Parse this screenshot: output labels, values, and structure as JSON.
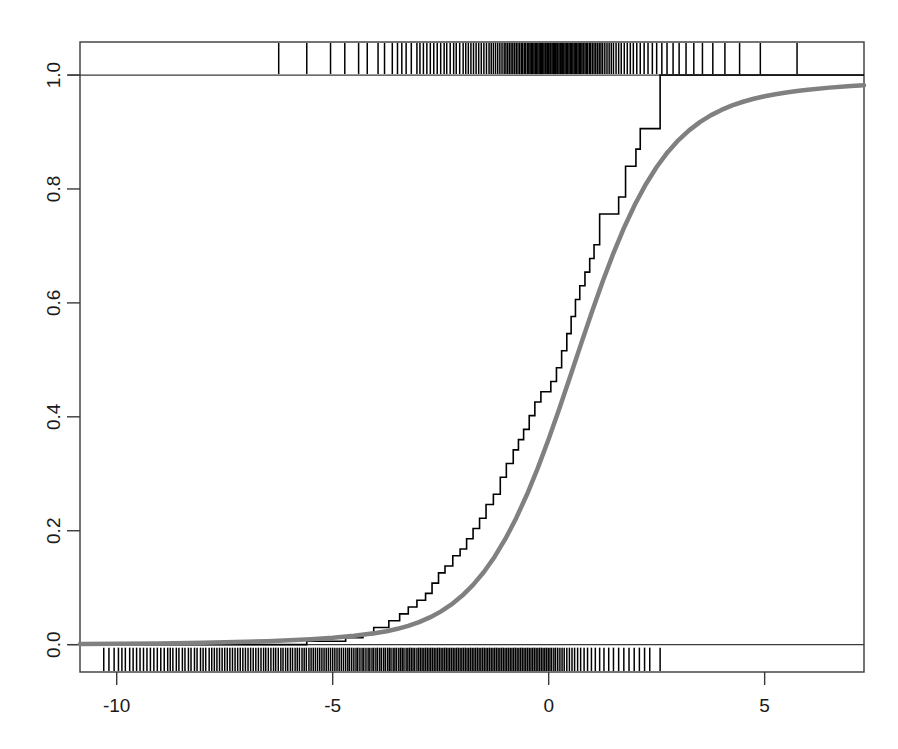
{
  "chart_data": {
    "type": "line",
    "title": "",
    "subtitle": "",
    "xlabel": "",
    "ylabel": "",
    "xlim": [
      -10.85,
      7.3
    ],
    "ylim": [
      -0.048,
      1.058
    ],
    "grid": false,
    "legend_position": "none",
    "xticks": [
      -10,
      -5,
      0,
      5
    ],
    "xticklabels": [
      "-10",
      "-5",
      "0",
      "5"
    ],
    "yticks": [
      0.0,
      0.2,
      0.4,
      0.6,
      0.8,
      1.0
    ],
    "yticklabels": [
      "0.0",
      "0.2",
      "0.4",
      "0.6",
      "0.8",
      "1.0"
    ],
    "series": [
      {
        "name": "empirical-cdf-step",
        "type": "step",
        "color": "#000000",
        "linewidth": 1.6,
        "points": [
          [
            -10.85,
            0.0
          ],
          [
            -5.6,
            0.0
          ],
          [
            -5.6,
            0.006
          ],
          [
            -4.7,
            0.006
          ],
          [
            -4.7,
            0.012
          ],
          [
            -4.3,
            0.012
          ],
          [
            -4.3,
            0.018
          ],
          [
            -4.05,
            0.018
          ],
          [
            -4.05,
            0.03
          ],
          [
            -3.7,
            0.03
          ],
          [
            -3.7,
            0.042
          ],
          [
            -3.45,
            0.042
          ],
          [
            -3.45,
            0.054
          ],
          [
            -3.25,
            0.054
          ],
          [
            -3.25,
            0.066
          ],
          [
            -3.05,
            0.066
          ],
          [
            -3.05,
            0.078
          ],
          [
            -2.85,
            0.078
          ],
          [
            -2.85,
            0.09
          ],
          [
            -2.7,
            0.09
          ],
          [
            -2.7,
            0.108
          ],
          [
            -2.55,
            0.108
          ],
          [
            -2.55,
            0.126
          ],
          [
            -2.4,
            0.126
          ],
          [
            -2.4,
            0.138
          ],
          [
            -2.22,
            0.138
          ],
          [
            -2.22,
            0.156
          ],
          [
            -2.05,
            0.156
          ],
          [
            -2.05,
            0.168
          ],
          [
            -1.9,
            0.168
          ],
          [
            -1.9,
            0.186
          ],
          [
            -1.75,
            0.186
          ],
          [
            -1.75,
            0.204
          ],
          [
            -1.6,
            0.204
          ],
          [
            -1.6,
            0.222
          ],
          [
            -1.45,
            0.222
          ],
          [
            -1.45,
            0.246
          ],
          [
            -1.28,
            0.246
          ],
          [
            -1.28,
            0.264
          ],
          [
            -1.12,
            0.264
          ],
          [
            -1.12,
            0.294
          ],
          [
            -0.98,
            0.294
          ],
          [
            -0.98,
            0.318
          ],
          [
            -0.82,
            0.318
          ],
          [
            -0.82,
            0.342
          ],
          [
            -0.7,
            0.342
          ],
          [
            -0.7,
            0.36
          ],
          [
            -0.58,
            0.36
          ],
          [
            -0.58,
            0.378
          ],
          [
            -0.45,
            0.378
          ],
          [
            -0.45,
            0.402
          ],
          [
            -0.32,
            0.402
          ],
          [
            -0.32,
            0.426
          ],
          [
            -0.18,
            0.426
          ],
          [
            -0.18,
            0.444
          ],
          [
            0.05,
            0.444
          ],
          [
            0.05,
            0.462
          ],
          [
            0.18,
            0.462
          ],
          [
            0.18,
            0.486
          ],
          [
            0.3,
            0.486
          ],
          [
            0.3,
            0.516
          ],
          [
            0.42,
            0.516
          ],
          [
            0.42,
            0.546
          ],
          [
            0.52,
            0.546
          ],
          [
            0.52,
            0.576
          ],
          [
            0.62,
            0.576
          ],
          [
            0.62,
            0.606
          ],
          [
            0.72,
            0.606
          ],
          [
            0.72,
            0.63
          ],
          [
            0.84,
            0.63
          ],
          [
            0.84,
            0.654
          ],
          [
            0.95,
            0.654
          ],
          [
            0.95,
            0.678
          ],
          [
            1.05,
            0.678
          ],
          [
            1.05,
            0.702
          ],
          [
            1.18,
            0.702
          ],
          [
            1.18,
            0.756
          ],
          [
            1.62,
            0.756
          ],
          [
            1.62,
            0.786
          ],
          [
            1.78,
            0.786
          ],
          [
            1.78,
            0.84
          ],
          [
            2.02,
            0.84
          ],
          [
            2.02,
            0.87
          ],
          [
            2.12,
            0.87
          ],
          [
            2.12,
            0.906
          ],
          [
            2.58,
            0.906
          ],
          [
            2.58,
            1.0
          ],
          [
            7.3,
            1.0
          ]
        ]
      },
      {
        "name": "fitted-cdf-curve",
        "type": "line",
        "color": "#808080",
        "linewidth": 4.5,
        "description": "smooth fitted cumulative distribution function",
        "points": [
          [
            -10.85,
            0.001
          ],
          [
            -10.0,
            0.0014
          ],
          [
            -9.0,
            0.0021
          ],
          [
            -8.0,
            0.0032
          ],
          [
            -7.0,
            0.0049
          ],
          [
            -6.5,
            0.0061
          ],
          [
            -6.0,
            0.0077
          ],
          [
            -5.5,
            0.0097
          ],
          [
            -5.0,
            0.0122
          ],
          [
            -4.5,
            0.0156
          ],
          [
            -4.0,
            0.0204
          ],
          [
            -3.75,
            0.0236
          ],
          [
            -3.5,
            0.0278
          ],
          [
            -3.25,
            0.033
          ],
          [
            -3.0,
            0.0396
          ],
          [
            -2.75,
            0.0478
          ],
          [
            -2.5,
            0.058
          ],
          [
            -2.25,
            0.0706
          ],
          [
            -2.0,
            0.0862
          ],
          [
            -1.75,
            0.105
          ],
          [
            -1.5,
            0.1276
          ],
          [
            -1.25,
            0.1544
          ],
          [
            -1.0,
            0.186
          ],
          [
            -0.75,
            0.2225
          ],
          [
            -0.5,
            0.264
          ],
          [
            -0.25,
            0.3104
          ],
          [
            0.0,
            0.361
          ],
          [
            0.25,
            0.415
          ],
          [
            0.5,
            0.4711
          ],
          [
            0.75,
            0.528
          ],
          [
            1.0,
            0.584
          ],
          [
            1.25,
            0.6375
          ],
          [
            1.5,
            0.6874
          ],
          [
            1.75,
            0.7328
          ],
          [
            2.0,
            0.7732
          ],
          [
            2.25,
            0.8084
          ],
          [
            2.5,
            0.8386
          ],
          [
            2.75,
            0.8641
          ],
          [
            3.0,
            0.8854
          ],
          [
            3.25,
            0.9029
          ],
          [
            3.5,
            0.9174
          ],
          [
            3.75,
            0.9292
          ],
          [
            4.0,
            0.9388
          ],
          [
            4.25,
            0.9467
          ],
          [
            4.5,
            0.9531
          ],
          [
            4.75,
            0.9584
          ],
          [
            5.0,
            0.9628
          ],
          [
            5.25,
            0.9664
          ],
          [
            5.5,
            0.9695
          ],
          [
            5.75,
            0.9721
          ],
          [
            6.0,
            0.9743
          ],
          [
            6.5,
            0.9779
          ],
          [
            7.0,
            0.9806
          ],
          [
            7.3,
            0.9819
          ]
        ]
      }
    ],
    "rug_top": {
      "name": "rug-marks-top",
      "color": "#000000",
      "values": [
        -6.25,
        -5.6,
        -5.05,
        -4.72,
        -4.4,
        -4.2,
        -3.95,
        -3.8,
        -3.62,
        -3.5,
        -3.4,
        -3.3,
        -3.18,
        -3.05,
        -2.98,
        -2.9,
        -2.82,
        -2.74,
        -2.66,
        -2.58,
        -2.5,
        -2.42,
        -2.36,
        -2.28,
        -2.2,
        -2.14,
        -2.06,
        -1.98,
        -1.92,
        -1.86,
        -1.8,
        -1.74,
        -1.68,
        -1.62,
        -1.56,
        -1.5,
        -1.44,
        -1.38,
        -1.33,
        -1.28,
        -1.23,
        -1.18,
        -1.13,
        -1.08,
        -1.03,
        -0.99,
        -0.95,
        -0.91,
        -0.87,
        -0.83,
        -0.79,
        -0.75,
        -0.71,
        -0.67,
        -0.63,
        -0.6,
        -0.56,
        -0.53,
        -0.49,
        -0.46,
        -0.43,
        -0.4,
        -0.37,
        -0.34,
        -0.31,
        -0.28,
        -0.25,
        -0.22,
        -0.19,
        -0.17,
        -0.14,
        -0.11,
        -0.08,
        -0.06,
        -0.03,
        0.0,
        0.03,
        0.05,
        0.08,
        0.11,
        0.13,
        0.16,
        0.19,
        0.21,
        0.24,
        0.27,
        0.29,
        0.32,
        0.35,
        0.38,
        0.41,
        0.44,
        0.47,
        0.5,
        0.53,
        0.56,
        0.59,
        0.62,
        0.65,
        0.68,
        0.71,
        0.74,
        0.77,
        0.8,
        0.84,
        0.87,
        0.9,
        0.94,
        0.97,
        1.01,
        1.05,
        1.09,
        1.13,
        1.17,
        1.21,
        1.25,
        1.3,
        1.35,
        1.4,
        1.45,
        1.5,
        1.56,
        1.62,
        1.68,
        1.75,
        1.82,
        1.89,
        1.96,
        2.04,
        2.12,
        2.21,
        2.3,
        2.4,
        2.5,
        2.62,
        2.74,
        2.88,
        3.02,
        3.18,
        3.36,
        3.56,
        3.8,
        4.08,
        4.42,
        4.9,
        5.75
      ]
    },
    "rug_bottom": {
      "name": "rug-marks-bottom",
      "color": "#000000",
      "values": [
        -10.3,
        -10.18,
        -10.06,
        -9.96,
        -9.88,
        -9.8,
        -9.7,
        -9.62,
        -9.54,
        -9.46,
        -9.38,
        -9.3,
        -9.22,
        -9.14,
        -9.06,
        -8.98,
        -8.9,
        -8.82,
        -8.76,
        -8.7,
        -8.62,
        -8.56,
        -8.48,
        -8.42,
        -8.34,
        -8.28,
        -8.2,
        -8.14,
        -8.06,
        -8.0,
        -7.94,
        -7.86,
        -7.8,
        -7.74,
        -7.68,
        -7.62,
        -7.56,
        -7.5,
        -7.44,
        -7.38,
        -7.32,
        -7.26,
        -7.2,
        -7.14,
        -7.08,
        -7.02,
        -6.96,
        -6.9,
        -6.84,
        -6.78,
        -6.72,
        -6.66,
        -6.6,
        -6.55,
        -6.49,
        -6.43,
        -6.37,
        -6.32,
        -6.26,
        -6.2,
        -6.15,
        -6.09,
        -6.04,
        -5.98,
        -5.93,
        -5.87,
        -5.82,
        -5.77,
        -5.71,
        -5.66,
        -5.61,
        -5.55,
        -5.5,
        -5.45,
        -5.4,
        -5.35,
        -5.3,
        -5.25,
        -5.2,
        -5.15,
        -5.1,
        -5.05,
        -5.0,
        -4.95,
        -4.9,
        -4.85,
        -4.8,
        -4.75,
        -4.7,
        -4.65,
        -4.61,
        -4.56,
        -4.51,
        -4.46,
        -4.42,
        -4.37,
        -4.32,
        -4.28,
        -4.23,
        -4.18,
        -4.14,
        -4.09,
        -4.05,
        -4.0,
        -3.96,
        -3.91,
        -3.87,
        -3.82,
        -3.78,
        -3.73,
        -3.69,
        -3.65,
        -3.6,
        -3.56,
        -3.52,
        -3.47,
        -3.43,
        -3.39,
        -3.35,
        -3.3,
        -3.26,
        -3.22,
        -3.18,
        -3.14,
        -3.1,
        -3.05,
        -3.01,
        -2.97,
        -2.93,
        -2.89,
        -2.85,
        -2.81,
        -2.77,
        -2.73,
        -2.69,
        -2.65,
        -2.61,
        -2.57,
        -2.53,
        -2.49,
        -2.45,
        -2.41,
        -2.37,
        -2.33,
        -2.29,
        -2.25,
        -2.21,
        -2.17,
        -2.13,
        -2.09,
        -2.05,
        -2.01,
        -1.97,
        -1.93,
        -1.89,
        -1.85,
        -1.81,
        -1.77,
        -1.73,
        -1.69,
        -1.65,
        -1.61,
        -1.57,
        -1.53,
        -1.49,
        -1.45,
        -1.41,
        -1.37,
        -1.33,
        -1.29,
        -1.25,
        -1.21,
        -1.17,
        -1.13,
        -1.09,
        -1.05,
        -1.01,
        -0.97,
        -0.93,
        -0.89,
        -0.85,
        -0.81,
        -0.77,
        -0.73,
        -0.69,
        -0.65,
        -0.61,
        -0.57,
        -0.53,
        -0.49,
        -0.45,
        -0.41,
        -0.37,
        -0.33,
        -0.29,
        -0.25,
        -0.21,
        -0.17,
        -0.13,
        -0.09,
        -0.05,
        -0.01,
        0.03,
        0.07,
        0.12,
        0.16,
        0.21,
        0.26,
        0.31,
        0.36,
        0.42,
        0.48,
        0.54,
        0.6,
        0.67,
        0.74,
        0.82,
        0.9,
        0.99,
        1.08,
        1.18,
        1.28,
        1.39,
        1.5,
        1.62,
        1.74,
        1.86,
        1.98,
        2.1,
        2.22,
        2.34,
        2.58
      ]
    }
  },
  "axes": {
    "x_tick_labels": [
      "-10",
      "-5",
      "0",
      "5"
    ],
    "y_tick_labels": [
      "0.0",
      "0.2",
      "0.4",
      "0.6",
      "0.8",
      "1.0"
    ]
  }
}
